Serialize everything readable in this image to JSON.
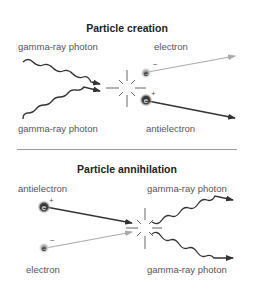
{
  "creation": {
    "title": "Particle creation",
    "labels": {
      "photon_top": "gamma-ray photon",
      "photon_bottom": "gamma-ray photon",
      "electron": "electron",
      "antielectron": "antielectron"
    },
    "particles": {
      "electron": {
        "symbol": "e",
        "charge": "−"
      },
      "antielectron": {
        "symbol": "e",
        "charge": "+"
      }
    }
  },
  "annihilation": {
    "title": "Particle annihilation",
    "labels": {
      "antielectron": "antielectron",
      "electron": "electron",
      "photon_top": "gamma-ray photon",
      "photon_bottom": "gamma-ray photon"
    },
    "particles": {
      "antielectron": {
        "symbol": "e",
        "charge": "+"
      },
      "electron": {
        "symbol": "e",
        "charge": "−"
      }
    }
  },
  "colors": {
    "dark_arrow": "#333333",
    "light_arrow": "#aaaaaa",
    "divider": "#999999"
  }
}
